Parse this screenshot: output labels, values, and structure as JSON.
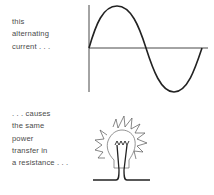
{
  "captions": {
    "top": [
      "this",
      "alternating",
      "current . . ."
    ],
    "bottom": [
      ". . . causes",
      "the same",
      "power",
      "transfer in",
      "a resistance . . ."
    ]
  },
  "figures": {
    "waveform": {
      "type": "sine",
      "cycles": 1,
      "label": "alternating current waveform"
    },
    "bulb": {
      "label": "glowing light bulb (resistance)"
    }
  },
  "colors": {
    "ink": "#2a2a2a",
    "text": "#4a4a4a",
    "background": "#ffffff"
  }
}
